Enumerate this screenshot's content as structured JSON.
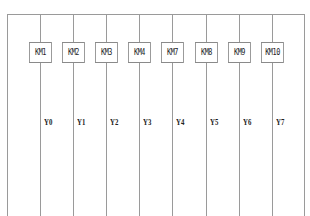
{
  "diagram": {
    "title": "",
    "contactors": [
      {
        "label": "KM1",
        "x": 40
      },
      {
        "label": "KM2",
        "x": 73
      },
      {
        "label": "KM3",
        "x": 106
      },
      {
        "label": "KM4",
        "x": 139
      },
      {
        "label": "KM7",
        "x": 172
      },
      {
        "label": "KM8",
        "x": 206
      },
      {
        "label": "KM9",
        "x": 239
      },
      {
        "label": "KM10",
        "x": 272
      }
    ],
    "outputs": [
      "Y0",
      "Y1",
      "Y2",
      "Y3",
      "Y4",
      "Y5",
      "Y6",
      "Y7"
    ],
    "colors": {
      "line": "#9a9a9a",
      "box_border": "#8a8a8a",
      "text": "#222222",
      "background": "#ffffff"
    }
  }
}
